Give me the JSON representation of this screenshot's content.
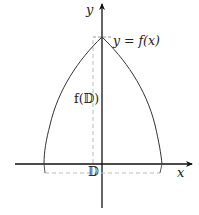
{
  "diagram": {
    "type": "function-image-plot",
    "axes": {
      "x_label": "x",
      "y_label": "y"
    },
    "curve_label": "y = f(x)",
    "image_label": "f(𝔻)",
    "domain_label": "𝔻",
    "colors": {
      "axis": "#111111",
      "curve": "#333333",
      "dashed": "#bbbbbb",
      "text": "#222222",
      "background": "#ffffff"
    },
    "geometry": {
      "origin_px": [
        102,
        164
      ],
      "peak_px": [
        102,
        37
      ],
      "curve_left_end_px": [
        44,
        164
      ],
      "curve_right_end_px": [
        162,
        164
      ],
      "domain_segment_y_px": 173,
      "domain_segment_x_px": [
        45,
        160
      ],
      "image_segment_x_px": 93,
      "image_segment_y_px": [
        40,
        164
      ]
    }
  }
}
